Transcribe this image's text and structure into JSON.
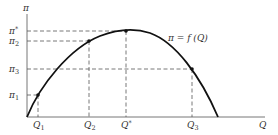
{
  "diagram": {
    "y_axis_label": "π",
    "x_axis_label": "Q",
    "curve_label": "π = f (Q)",
    "colors": {
      "axis": "#777777",
      "curve": "#111111",
      "dash": "#555555",
      "text": "#333333"
    },
    "y_labels": [
      {
        "id": "pi_star",
        "base": "π",
        "sup": "*",
        "y": 31
      },
      {
        "id": "pi_2",
        "base": "π",
        "sub": "2",
        "y": 41
      },
      {
        "id": "pi_3",
        "base": "π",
        "sub": "3",
        "y": 69
      },
      {
        "id": "pi_1",
        "base": "π",
        "sub": "1",
        "y": 95
      }
    ],
    "x_labels": [
      {
        "id": "q_1",
        "base": "Q",
        "sub": "1",
        "x": 38
      },
      {
        "id": "q_2",
        "base": "Q",
        "sub": "2",
        "x": 89
      },
      {
        "id": "q_star",
        "base": "Q",
        "sup": "*",
        "x": 126
      },
      {
        "id": "q_3",
        "base": "Q",
        "sub": "3",
        "x": 192
      }
    ],
    "points": [
      {
        "name": "point-q1",
        "x": 38,
        "y": 95
      },
      {
        "name": "point-q2",
        "x": 89,
        "y": 41
      },
      {
        "name": "point-qstar",
        "x": 126,
        "y": 31
      },
      {
        "name": "point-q3",
        "x": 192,
        "y": 69
      }
    ]
  }
}
